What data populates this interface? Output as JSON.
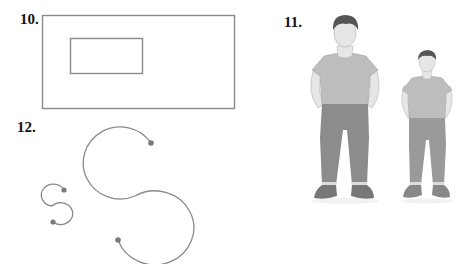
{
  "problems": [
    {
      "number": "10.",
      "kind": "nested-rectangles",
      "outer_rect": {
        "x": 42,
        "y": 15,
        "w": 192,
        "h": 93
      },
      "inner_rect": {
        "x": 70,
        "y": 38,
        "w": 72,
        "h": 35
      }
    },
    {
      "number": "11.",
      "kind": "two-men-different-sizes",
      "figures": [
        "large-man",
        "small-man"
      ]
    },
    {
      "number": "12.",
      "kind": "two-s-curves-different-sizes",
      "figures": [
        "small-s-curve",
        "large-s-curve"
      ]
    }
  ],
  "colors": {
    "line": "#8a8a8a",
    "dot": "#7a7a7a",
    "shirt": "#bdbdbd",
    "pants": "#8c8c8c",
    "skin": "#e6e6e6",
    "hair": "#555555",
    "shoe": "#777777",
    "sock": "#dddddd"
  }
}
